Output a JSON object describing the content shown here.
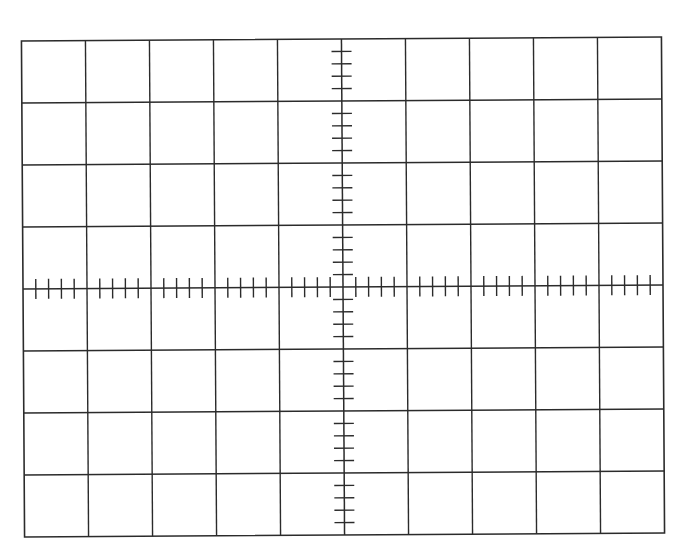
{
  "graticule": {
    "left": 23,
    "top": 39,
    "right": 663,
    "bottom": 535,
    "columns": 10,
    "rows": 8,
    "minor_subdivisions": 5,
    "tick_half_length": 10,
    "rotation_deg": -0.36,
    "line_color": "#2b2b2b",
    "background": "#ffffff"
  }
}
